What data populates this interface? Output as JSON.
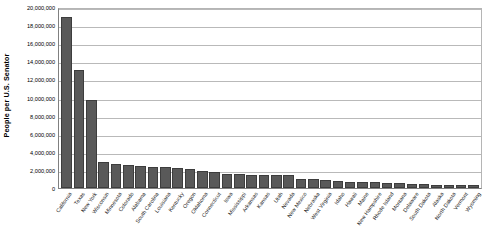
{
  "chart_data": {
    "type": "bar",
    "title": "",
    "xlabel": "",
    "ylabel": "People per U.S. Senator",
    "ylim": [
      0,
      20000000
    ],
    "ytick_labels": [
      "20,000,000",
      "18,000,000",
      "16,000,000",
      "14,000,000",
      "12,000,000",
      "10,000,000",
      "8,000,000",
      "6,000,000",
      "4,000,000",
      "2,000,000",
      "0"
    ],
    "yticks": [
      20000000,
      18000000,
      16000000,
      14000000,
      12000000,
      10000000,
      8000000,
      6000000,
      4000000,
      2000000,
      0
    ],
    "grid": true,
    "legend": "none",
    "bar_color": "#595959",
    "categories": [
      "California",
      "Texas",
      "New York",
      "Wisconsin",
      "Minnesota",
      "Colorado",
      "Alabama",
      "South Carolina",
      "Louisiana",
      "Kentucky",
      "Oregon",
      "Oklahoma",
      "Connecticut",
      "Iowa",
      "Mississippi",
      "Arkansas",
      "Kansas",
      "Utah",
      "Nevada",
      "New Mexico",
      "Nebraska",
      "West Virginia",
      "Idaho",
      "Hawaii",
      "Maine",
      "New Hampshire",
      "Rhode Island",
      "Montana",
      "Delaware",
      "South Dakota",
      "Alaska",
      "North Dakota",
      "Vermont",
      "Wyoming"
    ],
    "values": [
      18900000,
      13050000,
      9700000,
      2850000,
      2700000,
      2550000,
      2450000,
      2350000,
      2300000,
      2250000,
      2050000,
      1900000,
      1800000,
      1550000,
      1500000,
      1450000,
      1450000,
      1400000,
      1400000,
      1050000,
      950000,
      900000,
      800000,
      700000,
      680000,
      670000,
      550000,
      500000,
      450000,
      420000,
      380000,
      340000,
      320000,
      280000
    ]
  }
}
